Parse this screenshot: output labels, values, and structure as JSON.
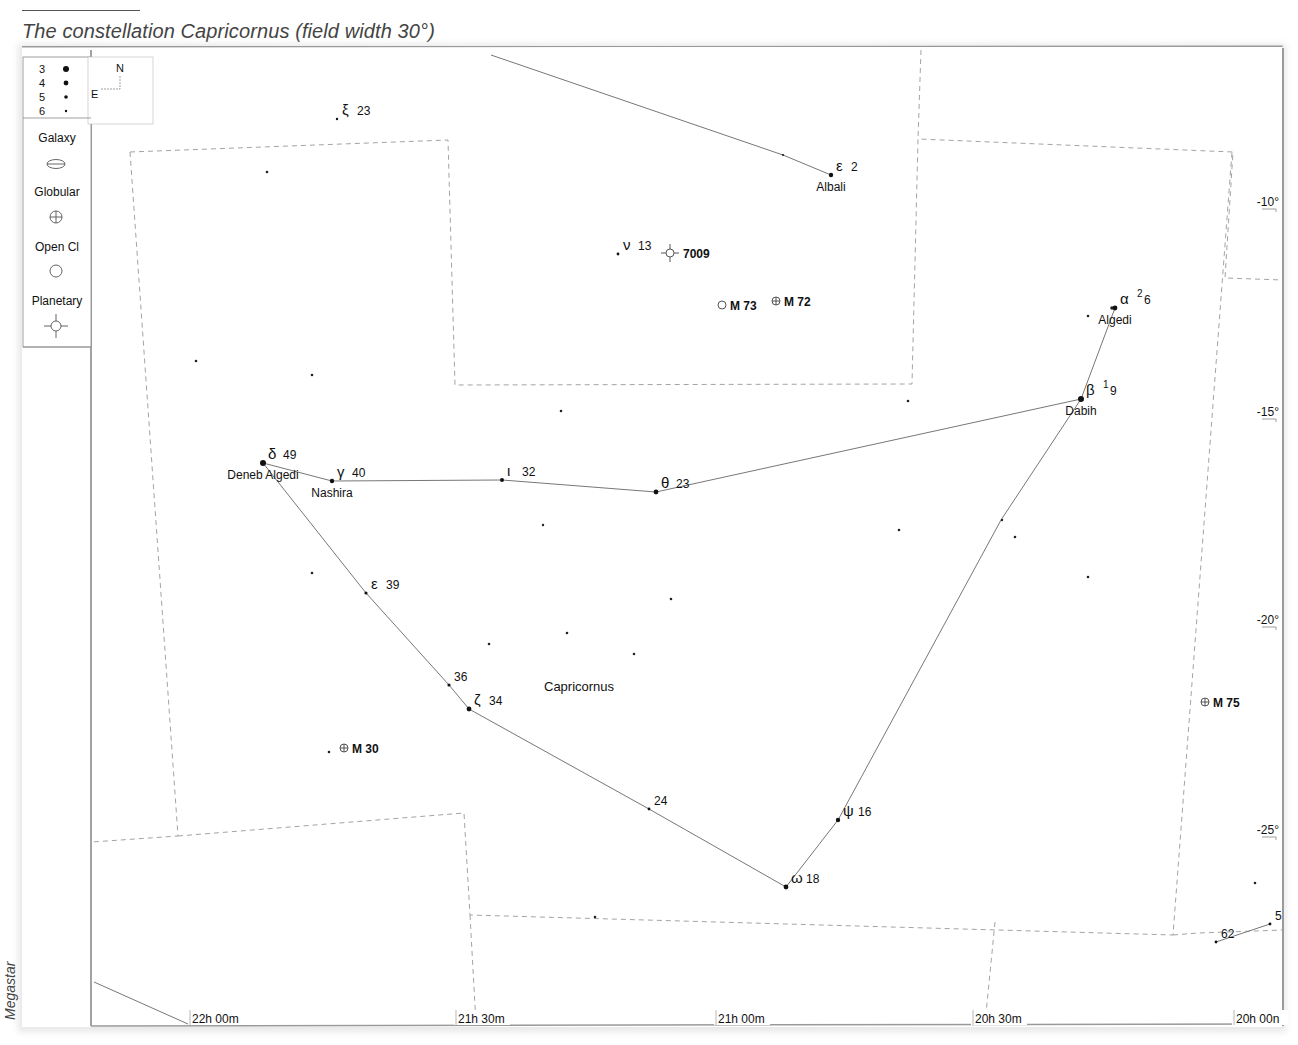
{
  "caption": "The constellation Capricornus (field width 30°)",
  "credit": "Megastar",
  "legend": {
    "magnitudes": [
      {
        "label": "3",
        "r": 3.0
      },
      {
        "label": "4",
        "r": 2.4
      },
      {
        "label": "5",
        "r": 1.8
      },
      {
        "label": "6",
        "r": 1.2
      }
    ],
    "compass": {
      "north": "N",
      "east": "E"
    },
    "object_types": [
      {
        "label": "Galaxy",
        "icon": "galaxy-icon"
      },
      {
        "label": "Globular",
        "icon": "globular-cluster-icon"
      },
      {
        "label": "Open Cl",
        "icon": "open-cluster-icon"
      },
      {
        "label": "Planetary",
        "icon": "planetary-nebula-icon"
      }
    ]
  },
  "axes": {
    "ra_labels": [
      {
        "label": "22h 00m",
        "x": 190
      },
      {
        "label": "21h 30m",
        "x": 456
      },
      {
        "label": "21h 00m",
        "x": 716
      },
      {
        "label": "20h 30m",
        "x": 973
      },
      {
        "label": "20h 00n",
        "x": 1234
      }
    ],
    "dec_labels": [
      {
        "label": "-10°",
        "y": 206
      },
      {
        "label": "-15°",
        "y": 416
      },
      {
        "label": "-20°",
        "y": 624
      },
      {
        "label": "-25°",
        "y": 834
      }
    ]
  },
  "constellation_label": "Capricornus",
  "stars": [
    {
      "id": "alpha",
      "greek": "α",
      "sup": "2",
      "num": "6",
      "name": "Algedi",
      "x": 1115,
      "y": 308,
      "r": 2.4
    },
    {
      "id": "beta",
      "greek": "β",
      "sup": "1",
      "num": "9",
      "name": "Dabih",
      "x": 1081,
      "y": 399,
      "r": 3.0
    },
    {
      "id": "delta",
      "greek": "δ",
      "num": "49",
      "name": "Deneb Algedi",
      "x": 263,
      "y": 463,
      "r": 3.0
    },
    {
      "id": "gamma",
      "greek": "γ",
      "num": "40",
      "name": "Nashira",
      "x": 332,
      "y": 481,
      "r": 2.2
    },
    {
      "id": "iota",
      "greek": "ι",
      "num": "32",
      "x": 502,
      "y": 480,
      "r": 2.0
    },
    {
      "id": "theta",
      "greek": "θ",
      "num": "23",
      "x": 656,
      "y": 492,
      "r": 2.4
    },
    {
      "id": "epsilon-39",
      "greek": "ε",
      "num": "39",
      "x": 366,
      "y": 593,
      "r": 1.6
    },
    {
      "id": "36",
      "num": "36",
      "x": 449,
      "y": 685,
      "r": 1.6
    },
    {
      "id": "zeta",
      "greek": "ζ",
      "num": "34",
      "x": 469,
      "y": 709,
      "r": 2.4
    },
    {
      "id": "24",
      "num": "24",
      "x": 649,
      "y": 809,
      "r": 1.4
    },
    {
      "id": "omega",
      "greek": "ω",
      "num": "18",
      "x": 786,
      "y": 887,
      "r": 2.4
    },
    {
      "id": "psi",
      "greek": "ψ",
      "num": "16",
      "x": 838,
      "y": 820,
      "r": 2.2
    },
    {
      "id": "epsilon-2",
      "greek": "ε",
      "num": "2",
      "name": "Albali",
      "x": 831,
      "y": 175,
      "r": 2.2
    },
    {
      "id": "nu",
      "greek": "ν",
      "num": "13",
      "x": 618,
      "y": 254,
      "r": 1.4
    },
    {
      "id": "xi",
      "greek": "ξ",
      "num": "23",
      "x": 337,
      "y": 119,
      "r": 1.2
    },
    {
      "id": "62",
      "num": "62",
      "x": 1216,
      "y": 942,
      "r": 1.4
    },
    {
      "id": "5x",
      "num": "5",
      "x": 1270,
      "y": 924,
      "r": 1.4
    }
  ],
  "field_stars": [
    [
      267,
      172,
      1.3
    ],
    [
      196,
      361,
      1.3
    ],
    [
      312,
      375,
      1.3
    ],
    [
      561,
      411,
      1.3
    ],
    [
      908,
      401,
      1.3
    ],
    [
      543,
      525,
      1.2
    ],
    [
      899,
      530,
      1.3
    ],
    [
      1002,
      520,
      1.2
    ],
    [
      1015,
      537,
      1.3
    ],
    [
      1088,
      577,
      1.3
    ],
    [
      312,
      573,
      1.3
    ],
    [
      671,
      599,
      1.3
    ],
    [
      567,
      633,
      1.3
    ],
    [
      489,
      644,
      1.3
    ],
    [
      634,
      654,
      1.3
    ],
    [
      329,
      752,
      1.3
    ],
    [
      1088,
      316,
      1.3
    ],
    [
      1112,
      308,
      1.8
    ],
    [
      595,
      917,
      1.3
    ],
    [
      1255,
      883,
      1.3
    ],
    [
      783,
      155,
      1.1
    ]
  ],
  "deep_sky": [
    {
      "label": "7009",
      "type": "planetary",
      "x": 670,
      "y": 253
    },
    {
      "label": "M 73",
      "type": "open",
      "x": 722,
      "y": 305
    },
    {
      "label": "M 72",
      "type": "globular",
      "x": 776,
      "y": 301
    },
    {
      "label": "M 30",
      "type": "globular",
      "x": 344,
      "y": 748
    },
    {
      "label": "M 75",
      "type": "globular",
      "x": 1205,
      "y": 702
    }
  ],
  "figure_lines": [
    [
      [
        491,
        55
      ],
      [
        783,
        155
      ],
      [
        831,
        175
      ]
    ],
    [
      [
        1115,
        308
      ],
      [
        1081,
        399
      ],
      [
        1001,
        520
      ],
      [
        838,
        820
      ],
      [
        786,
        887
      ],
      [
        649,
        809
      ],
      [
        469,
        709
      ],
      [
        449,
        685
      ],
      [
        366,
        593
      ],
      [
        263,
        463
      ],
      [
        332,
        481
      ],
      [
        502,
        480
      ],
      [
        656,
        492
      ],
      [
        1081,
        399
      ]
    ],
    [
      [
        1216,
        942
      ],
      [
        1270,
        924
      ]
    ],
    [
      [
        94,
        982
      ],
      [
        188,
        1024
      ]
    ]
  ],
  "boundaries": [
    [
      [
        130,
        152
      ],
      [
        448,
        140
      ],
      [
        455,
        385
      ],
      [
        912,
        384
      ],
      [
        918,
        139
      ],
      [
        1233,
        152
      ],
      [
        1225,
        278
      ],
      [
        1283,
        280
      ]
    ],
    [
      [
        130,
        152
      ],
      [
        178,
        836
      ],
      [
        92,
        842
      ]
    ],
    [
      [
        178,
        836
      ],
      [
        464,
        813
      ],
      [
        470,
        915
      ],
      [
        1173,
        935
      ],
      [
        1232,
        152
      ]
    ],
    [
      [
        470,
        915
      ],
      [
        476,
        1024
      ]
    ],
    [
      [
        921,
        50
      ],
      [
        918,
        139
      ]
    ],
    [
      [
        1173,
        935
      ],
      [
        1198,
        933
      ],
      [
        1283,
        930
      ]
    ],
    [
      [
        995,
        922
      ],
      [
        985,
        1024
      ]
    ]
  ]
}
